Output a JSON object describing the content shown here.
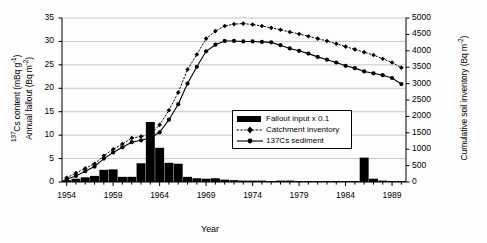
{
  "chart_data": {
    "type": "line",
    "title": "",
    "xlabel": "Year",
    "ylabel_left_line1": "137Cs content (mBq g-1)",
    "ylabel_left_line2": "Annual fallout (Bq m-2)",
    "ylabel_right": "Cumulative soil inventory (Bq m-2)",
    "xlim": [
      1953.5,
      1990.5
    ],
    "ylim_left": [
      0,
      35
    ],
    "ylim_right": [
      0,
      5000
    ],
    "grid": true,
    "legend_position": "inside-right-middle",
    "x_tick_labels": [
      "1954",
      "1959",
      "1964",
      "1969",
      "1974",
      "1979",
      "1984",
      "1989"
    ],
    "x_tick_values": [
      1954,
      1959,
      1964,
      1969,
      1974,
      1979,
      1984,
      1989
    ],
    "y_left_ticks": [
      0,
      5,
      10,
      15,
      20,
      25,
      30,
      35
    ],
    "y_right_ticks": [
      0,
      500,
      1000,
      1500,
      2000,
      2500,
      3000,
      3500,
      4000,
      4500,
      5000
    ],
    "x": [
      1954,
      1955,
      1956,
      1957,
      1958,
      1959,
      1960,
      1961,
      1962,
      1963,
      1964,
      1965,
      1966,
      1967,
      1968,
      1969,
      1970,
      1971,
      1972,
      1973,
      1974,
      1975,
      1976,
      1977,
      1978,
      1979,
      1980,
      1981,
      1982,
      1983,
      1984,
      1985,
      1986,
      1987,
      1988,
      1989,
      1990
    ],
    "series": [
      {
        "name": "Fallout input x 0.1",
        "type": "bar",
        "axis": "left",
        "color": "#000000",
        "values": [
          0.4,
          0.7,
          1.0,
          1.3,
          2.6,
          2.7,
          1.1,
          1.1,
          4.0,
          12.8,
          7.3,
          4.1,
          3.9,
          1.1,
          0.8,
          0.7,
          0.8,
          0.5,
          0.4,
          0.3,
          0.3,
          0.3,
          0.2,
          0.3,
          0.3,
          0.2,
          0.2,
          0.2,
          0.2,
          0.2,
          0.2,
          0.2,
          5.2,
          0.7,
          0.3,
          0.2,
          0.2
        ]
      },
      {
        "name": "Catchment inventory",
        "type": "line",
        "style": "dotted",
        "marker": "diamond",
        "axis": "right",
        "color": "#000000",
        "values_left_scale": [
          0.9,
          1.9,
          2.9,
          3.9,
          5.6,
          7.0,
          8.1,
          9.4,
          9.7,
          10.2,
          12.2,
          15.3,
          19.1,
          24.0,
          27.2,
          30.6,
          32.2,
          33.3,
          33.7,
          33.8,
          33.6,
          33.3,
          32.9,
          32.5,
          32.0,
          31.6,
          31.1,
          30.6,
          30.1,
          29.5,
          28.9,
          28.3,
          27.7,
          27.1,
          26.3,
          25.5,
          24.4
        ]
      },
      {
        "name": "137Cs sediment",
        "type": "line",
        "style": "solid",
        "marker": "circle",
        "axis": "left",
        "color": "#000000",
        "values": [
          0.6,
          1.3,
          2.3,
          3.3,
          5.0,
          6.3,
          7.4,
          8.5,
          8.9,
          9.4,
          10.6,
          13.3,
          16.6,
          21.0,
          24.6,
          27.9,
          29.3,
          30.1,
          30.1,
          30.0,
          30.0,
          29.9,
          29.8,
          29.2,
          28.5,
          28.0,
          27.4,
          26.7,
          26.1,
          25.5,
          24.8,
          24.3,
          23.6,
          23.2,
          22.8,
          22.2,
          20.9
        ]
      }
    ]
  },
  "legend": {
    "items": [
      {
        "label": "Fallout input x 0.1",
        "symbol": "filled-bar"
      },
      {
        "label": "Catchment inventory",
        "symbol": "dotted-diamond-line"
      },
      {
        "label": "137Cs sediment",
        "symbol": "solid-circle-line"
      }
    ]
  }
}
